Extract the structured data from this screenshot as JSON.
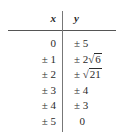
{
  "table": {
    "headers": {
      "x": "x",
      "y": "y"
    },
    "rows": [
      {
        "x": "0",
        "y_prefix": "± 5",
        "y_sqrt": ""
      },
      {
        "x": "± 1",
        "y_prefix": "± 2",
        "y_sqrt": "6"
      },
      {
        "x": "± 2",
        "y_prefix": "±",
        "y_sqrt": "21"
      },
      {
        "x": "± 3",
        "y_prefix": "± 4",
        "y_sqrt": ""
      },
      {
        "x": "± 4",
        "y_prefix": "± 3",
        "y_sqrt": ""
      },
      {
        "x": "± 5",
        "y_prefix": "  0",
        "y_sqrt": ""
      }
    ]
  }
}
